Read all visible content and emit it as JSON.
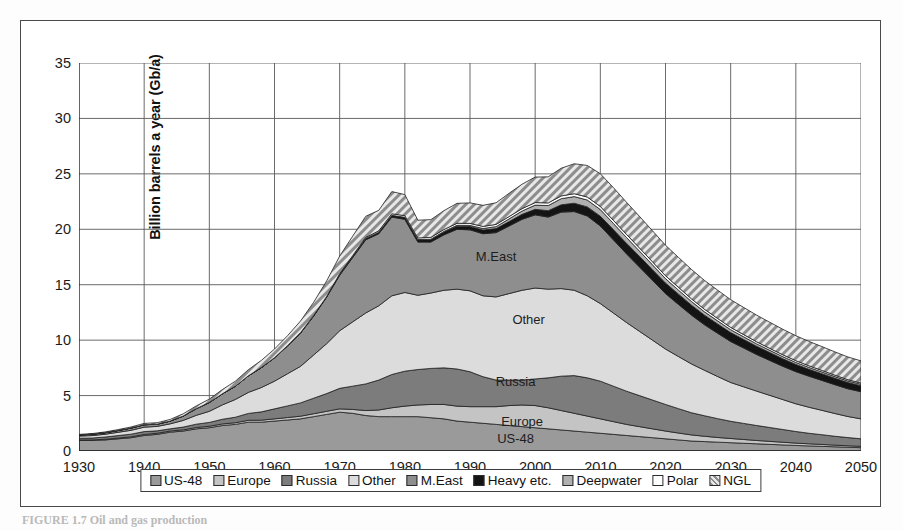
{
  "figure": {
    "caption": "FIGURE 1.7  Oil and gas production",
    "frame_color": "#4a4a4a"
  },
  "chart_data": {
    "type": "area",
    "stacked": true,
    "title": "",
    "xlabel": "",
    "ylabel": "Billion barrels a year (Gb/a)",
    "xlim": [
      1930,
      2050
    ],
    "ylim": [
      0,
      35
    ],
    "ytick_labels": [
      "0",
      "5",
      "10",
      "15",
      "20",
      "25",
      "30",
      "35"
    ],
    "yticks": [
      0,
      5,
      10,
      15,
      20,
      25,
      30,
      35
    ],
    "xtick_labels": [
      "1930",
      "1940",
      "1950",
      "1960",
      "1970",
      "1980",
      "1990",
      "2000",
      "2010",
      "2020",
      "2030",
      "2040",
      "2050"
    ],
    "xticks": [
      1930,
      1940,
      1950,
      1960,
      1970,
      1980,
      1990,
      2000,
      2010,
      2020,
      2030,
      2040,
      2050
    ],
    "grid": true,
    "legend_position": "bottom",
    "x": [
      1930,
      1932,
      1934,
      1936,
      1938,
      1940,
      1942,
      1944,
      1946,
      1948,
      1950,
      1952,
      1954,
      1956,
      1958,
      1960,
      1962,
      1964,
      1966,
      1968,
      1970,
      1972,
      1974,
      1976,
      1978,
      1980,
      1982,
      1984,
      1986,
      1988,
      1990,
      1992,
      1994,
      1996,
      1998,
      2000,
      2002,
      2004,
      2006,
      2008,
      2010,
      2012,
      2014,
      2016,
      2018,
      2020,
      2022,
      2024,
      2026,
      2028,
      2030,
      2032,
      2034,
      2036,
      2038,
      2040,
      2042,
      2044,
      2046,
      2048,
      2050
    ],
    "series": [
      {
        "name": "US-48",
        "color": "#9a9a9a",
        "pattern": "solid",
        "values": [
          0.95,
          0.95,
          1.0,
          1.1,
          1.2,
          1.4,
          1.5,
          1.7,
          1.8,
          2.0,
          2.1,
          2.3,
          2.4,
          2.6,
          2.6,
          2.7,
          2.8,
          2.9,
          3.1,
          3.3,
          3.5,
          3.4,
          3.2,
          3.1,
          3.1,
          3.1,
          3.1,
          3.0,
          2.9,
          2.7,
          2.6,
          2.5,
          2.4,
          2.3,
          2.2,
          2.1,
          2.0,
          1.9,
          1.8,
          1.7,
          1.6,
          1.5,
          1.4,
          1.3,
          1.2,
          1.1,
          1.0,
          0.9,
          0.85,
          0.8,
          0.75,
          0.7,
          0.65,
          0.6,
          0.55,
          0.5,
          0.46,
          0.42,
          0.38,
          0.34,
          0.3
        ]
      },
      {
        "name": "Europe",
        "color": "#c4c4c4",
        "pattern": "solid",
        "values": [
          0.05,
          0.05,
          0.06,
          0.07,
          0.08,
          0.09,
          0.1,
          0.1,
          0.11,
          0.12,
          0.13,
          0.14,
          0.15,
          0.17,
          0.18,
          0.2,
          0.22,
          0.24,
          0.26,
          0.28,
          0.3,
          0.35,
          0.45,
          0.6,
          0.8,
          0.95,
          1.05,
          1.2,
          1.3,
          1.35,
          1.4,
          1.5,
          1.6,
          1.8,
          1.95,
          2.0,
          1.9,
          1.75,
          1.6,
          1.45,
          1.3,
          1.15,
          1.0,
          0.9,
          0.8,
          0.7,
          0.62,
          0.55,
          0.48,
          0.42,
          0.38,
          0.34,
          0.3,
          0.27,
          0.24,
          0.21,
          0.19,
          0.17,
          0.15,
          0.13,
          0.12
        ]
      },
      {
        "name": "Russia",
        "color": "#7c7c7c",
        "pattern": "solid",
        "values": [
          0.15,
          0.17,
          0.2,
          0.22,
          0.24,
          0.26,
          0.22,
          0.2,
          0.25,
          0.3,
          0.35,
          0.42,
          0.5,
          0.62,
          0.75,
          0.9,
          1.05,
          1.2,
          1.4,
          1.6,
          1.85,
          2.1,
          2.4,
          2.7,
          3.0,
          3.15,
          3.2,
          3.25,
          3.3,
          3.35,
          3.15,
          2.7,
          2.4,
          2.3,
          2.25,
          2.4,
          2.7,
          3.1,
          3.4,
          3.45,
          3.4,
          3.2,
          3.0,
          2.8,
          2.6,
          2.4,
          2.2,
          2.0,
          1.85,
          1.7,
          1.55,
          1.45,
          1.35,
          1.25,
          1.15,
          1.05,
          0.95,
          0.88,
          0.8,
          0.74,
          0.68
        ]
      },
      {
        "name": "Other",
        "color": "#dcdcdc",
        "pattern": "solid",
        "values": [
          0.2,
          0.22,
          0.25,
          0.3,
          0.35,
          0.4,
          0.4,
          0.45,
          0.6,
          0.8,
          1.0,
          1.3,
          1.6,
          1.9,
          2.2,
          2.5,
          2.9,
          3.3,
          3.9,
          4.5,
          5.2,
          5.8,
          6.4,
          6.7,
          7.1,
          7.1,
          6.7,
          6.8,
          7.0,
          7.2,
          7.3,
          7.3,
          7.5,
          7.8,
          8.1,
          8.2,
          8.0,
          7.9,
          7.7,
          7.4,
          7.0,
          6.6,
          6.2,
          5.8,
          5.4,
          5.0,
          4.7,
          4.4,
          4.1,
          3.8,
          3.5,
          3.3,
          3.1,
          2.9,
          2.7,
          2.5,
          2.35,
          2.2,
          2.05,
          1.9,
          1.8
        ]
      },
      {
        "name": "M.East",
        "color": "#8e8e8e",
        "pattern": "solid",
        "values": [
          0.1,
          0.12,
          0.14,
          0.16,
          0.2,
          0.22,
          0.2,
          0.25,
          0.4,
          0.6,
          0.8,
          1.0,
          1.2,
          1.5,
          1.8,
          2.1,
          2.5,
          3.0,
          3.5,
          4.2,
          5.0,
          5.8,
          6.6,
          6.5,
          7.1,
          6.6,
          4.8,
          4.6,
          5.0,
          5.4,
          5.5,
          5.6,
          5.8,
          6.1,
          6.4,
          6.6,
          6.5,
          6.9,
          7.1,
          7.2,
          7.0,
          6.6,
          6.2,
          5.8,
          5.4,
          5.0,
          4.7,
          4.4,
          4.1,
          3.9,
          3.7,
          3.5,
          3.3,
          3.15,
          3.0,
          2.9,
          2.8,
          2.7,
          2.6,
          2.5,
          2.45
        ]
      },
      {
        "name": "Heavy etc.",
        "color": "#141414",
        "pattern": "solid",
        "values": [
          0.0,
          0.0,
          0.0,
          0.0,
          0.0,
          0.0,
          0.0,
          0.0,
          0.0,
          0.0,
          0.0,
          0.0,
          0.0,
          0.0,
          0.0,
          0.02,
          0.03,
          0.04,
          0.05,
          0.06,
          0.08,
          0.1,
          0.12,
          0.14,
          0.16,
          0.18,
          0.2,
          0.22,
          0.25,
          0.28,
          0.3,
          0.33,
          0.36,
          0.4,
          0.45,
          0.5,
          0.58,
          0.66,
          0.75,
          0.82,
          0.88,
          0.92,
          0.95,
          0.96,
          0.96,
          0.95,
          0.93,
          0.9,
          0.87,
          0.84,
          0.8,
          0.77,
          0.74,
          0.71,
          0.68,
          0.65,
          0.62,
          0.6,
          0.58,
          0.56,
          0.54
        ]
      },
      {
        "name": "Deepwater",
        "color": "#b0b0b0",
        "pattern": "solid",
        "values": [
          0.0,
          0.0,
          0.0,
          0.0,
          0.0,
          0.0,
          0.0,
          0.0,
          0.0,
          0.0,
          0.0,
          0.0,
          0.0,
          0.0,
          0.0,
          0.0,
          0.0,
          0.0,
          0.0,
          0.0,
          0.0,
          0.0,
          0.0,
          0.0,
          0.0,
          0.0,
          0.02,
          0.04,
          0.06,
          0.08,
          0.1,
          0.14,
          0.18,
          0.24,
          0.3,
          0.38,
          0.46,
          0.55,
          0.6,
          0.62,
          0.6,
          0.56,
          0.52,
          0.48,
          0.44,
          0.4,
          0.36,
          0.33,
          0.3,
          0.28,
          0.26,
          0.24,
          0.22,
          0.2,
          0.19,
          0.18,
          0.17,
          0.16,
          0.15,
          0.14,
          0.13
        ]
      },
      {
        "name": "Polar",
        "color": "#ffffff",
        "pattern": "solid",
        "values": [
          0.0,
          0.0,
          0.0,
          0.0,
          0.0,
          0.0,
          0.0,
          0.0,
          0.0,
          0.0,
          0.0,
          0.0,
          0.0,
          0.0,
          0.0,
          0.0,
          0.0,
          0.0,
          0.0,
          0.0,
          0.05,
          0.08,
          0.1,
          0.12,
          0.14,
          0.15,
          0.15,
          0.16,
          0.17,
          0.18,
          0.18,
          0.19,
          0.2,
          0.21,
          0.22,
          0.23,
          0.24,
          0.25,
          0.26,
          0.27,
          0.28,
          0.28,
          0.28,
          0.28,
          0.27,
          0.26,
          0.25,
          0.24,
          0.23,
          0.22,
          0.21,
          0.2,
          0.19,
          0.18,
          0.17,
          0.16,
          0.15,
          0.14,
          0.13,
          0.12,
          0.11
        ]
      },
      {
        "name": "NGL",
        "color": "#b8b8b8",
        "pattern": "hatch",
        "values": [
          0.05,
          0.06,
          0.07,
          0.08,
          0.1,
          0.12,
          0.13,
          0.15,
          0.2,
          0.25,
          0.3,
          0.38,
          0.45,
          0.55,
          0.65,
          0.78,
          0.9,
          1.05,
          1.2,
          1.4,
          1.6,
          1.75,
          1.9,
          1.85,
          2.0,
          1.9,
          1.6,
          1.6,
          1.7,
          1.8,
          1.85,
          1.9,
          1.95,
          2.1,
          2.2,
          2.3,
          2.35,
          2.5,
          2.7,
          2.85,
          2.95,
          2.95,
          2.9,
          2.85,
          2.8,
          2.75,
          2.7,
          2.65,
          2.6,
          2.55,
          2.5,
          2.45,
          2.4,
          2.35,
          2.3,
          2.25,
          2.2,
          2.15,
          2.1,
          2.05,
          2.0
        ]
      }
    ],
    "annotations": [
      {
        "text": "M.East",
        "x": 1994,
        "y": 17.6
      },
      {
        "text": "Other",
        "x": 1999,
        "y": 11.9
      },
      {
        "text": "Russia",
        "x": 1997,
        "y": 6.3
      },
      {
        "text": "Europe",
        "x": 1998,
        "y": 2.7
      },
      {
        "text": "US-48",
        "x": 1997,
        "y": 1.15
      }
    ],
    "legend": [
      {
        "label": "US-48",
        "color": "#9a9a9a",
        "pattern": "solid"
      },
      {
        "label": "Europe",
        "color": "#c4c4c4",
        "pattern": "solid"
      },
      {
        "label": "Russia",
        "color": "#7c7c7c",
        "pattern": "solid"
      },
      {
        "label": "Other",
        "color": "#dcdcdc",
        "pattern": "solid"
      },
      {
        "label": "M.East",
        "color": "#8e8e8e",
        "pattern": "solid"
      },
      {
        "label": "Heavy etc.",
        "color": "#141414",
        "pattern": "solid"
      },
      {
        "label": "Deepwater",
        "color": "#b0b0b0",
        "pattern": "solid"
      },
      {
        "label": "Polar",
        "color": "#ffffff",
        "pattern": "solid"
      },
      {
        "label": "NGL",
        "color": "#b8b8b8",
        "pattern": "hatch"
      }
    ]
  }
}
